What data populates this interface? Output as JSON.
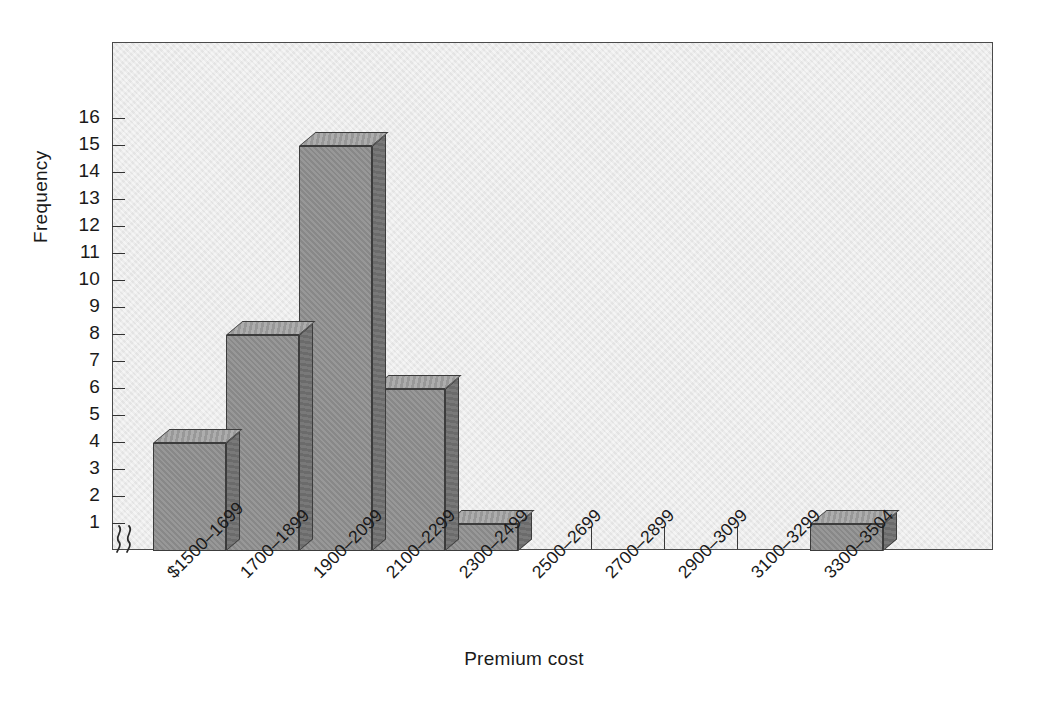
{
  "chart_data": {
    "type": "bar",
    "title": "",
    "xlabel": "Premium cost",
    "ylabel": "Frequency",
    "categories": [
      "$1500–1699",
      "1700–1899",
      "1900–2099",
      "2100–2299",
      "2300–2499",
      "2500–2699",
      "2700–2899",
      "2900–3099",
      "3100–3299",
      "3300–3504"
    ],
    "values": [
      4,
      8,
      15,
      6,
      1,
      0,
      0,
      0,
      0,
      1
    ],
    "ytick_labels": [
      "1",
      "2",
      "3",
      "4",
      "5",
      "6",
      "7",
      "8",
      "9",
      "10",
      "11",
      "12",
      "13",
      "14",
      "15",
      "16"
    ],
    "ytick_values": [
      1,
      2,
      3,
      4,
      5,
      6,
      7,
      8,
      9,
      10,
      11,
      12,
      13,
      14,
      15,
      16
    ],
    "ylim": [
      0,
      17.5
    ],
    "grid": false,
    "legend": null,
    "axis_break": "≻≻",
    "axis_break_note": "y-axis break symbol at origin",
    "colors": {
      "bar_front": "#8c8c8c",
      "bar_top": "#9b9b9b",
      "bar_side": "#6f6f6f",
      "bar_outline": "#3c3c3c",
      "plot_background": "#e9e9e9",
      "frame": "#4a4a4a",
      "text": "#1a1a1a",
      "page_background": "#ffffff"
    }
  }
}
